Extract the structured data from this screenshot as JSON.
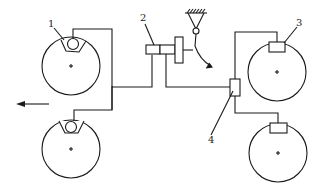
{
  "diagram": {
    "type": "brake-system-schematic",
    "line_color": "#1a1a1a",
    "background": "#ffffff",
    "labels": [
      {
        "id": "1",
        "text": "1",
        "x": 50,
        "y": 26
      },
      {
        "id": "2",
        "text": "2",
        "x": 142,
        "y": 21
      },
      {
        "id": "3",
        "text": "3",
        "x": 296,
        "y": 26
      },
      {
        "id": "4",
        "text": "4",
        "x": 209,
        "y": 143
      }
    ],
    "components": {
      "wheel_front_left": "wheel with cam-type brake shoe",
      "wheel_rear_left": "wheel with cam-type brake shoe",
      "wheel_front_right": "wheel with rectangular brake pad",
      "wheel_rear_right": "wheel with rectangular brake pad",
      "valve_2": "brake valve actuated by pedal",
      "valve_4": "relay / distribution valve",
      "pedal_pivot": "fixed pivot with ground hatching"
    },
    "direction_arrow": {
      "direction": "left"
    }
  }
}
